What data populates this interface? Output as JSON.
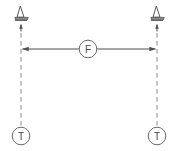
{
  "diagram": {
    "background_color": "#ffffff",
    "line_color": "#5a5a5a",
    "dash_color": "#8a8a8a",
    "label_color": "#4a4a4a",
    "dimension": {
      "name": "horizontal-dimension",
      "label": "F",
      "style": "double-headed-arrow",
      "orientation": "horizontal",
      "from_x": 21,
      "to_x": 157,
      "y": 49
    },
    "fixtures": [
      {
        "id": "fixture-left",
        "icon": "cone-marker-icon",
        "x": 21,
        "y": 14,
        "pointer": "up-arrow"
      },
      {
        "id": "fixture-right",
        "icon": "cone-marker-icon",
        "x": 157,
        "y": 14,
        "pointer": "up-arrow"
      }
    ],
    "terminals": [
      {
        "id": "terminal-left",
        "label": "T",
        "x": 21,
        "y": 136,
        "radius": 9
      },
      {
        "id": "terminal-right",
        "label": "T",
        "x": 157,
        "y": 136,
        "radius": 9
      }
    ],
    "axes": [
      {
        "id": "axis-left",
        "x": 21,
        "from_y": 24,
        "to_y": 127,
        "style": "dashed"
      },
      {
        "id": "axis-right",
        "x": 157,
        "from_y": 24,
        "to_y": 127,
        "style": "dashed"
      }
    ]
  }
}
